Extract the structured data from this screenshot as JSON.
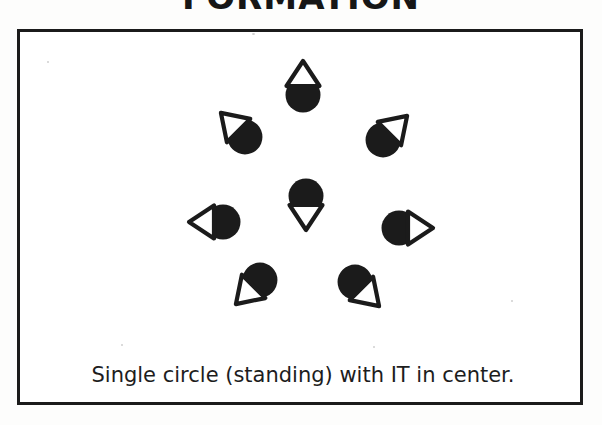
{
  "page": {
    "heading": "FORMATION",
    "caption": "Single circle (standing) with IT in center.",
    "colors": {
      "ink": "#1b1b1b",
      "paper": "#ffffff",
      "page_background": "#fdfdfc"
    }
  },
  "diagram": {
    "type": "formation-diagram",
    "symbol_legend": {
      "head": "filled black circle",
      "body": "outlined triangle pointing in facing direction"
    },
    "center_marker": "IT",
    "people": [
      {
        "id": "player-top",
        "role": "player",
        "position": "top",
        "cx": 283,
        "cy": 56,
        "facing_deg": 180,
        "label": ""
      },
      {
        "id": "player-upper-left",
        "role": "player",
        "position": "upper-left",
        "cx": 220,
        "cy": 100,
        "facing_deg": 135,
        "label": ""
      },
      {
        "id": "player-upper-right",
        "role": "player",
        "position": "upper-right",
        "cx": 368,
        "cy": 103,
        "facing_deg": 225,
        "label": ""
      },
      {
        "id": "it-center",
        "role": "it",
        "position": "center",
        "cx": 286,
        "cy": 171,
        "facing_deg": 0,
        "label": "IT"
      },
      {
        "id": "player-left",
        "role": "player",
        "position": "left",
        "cx": 196,
        "cy": 190,
        "facing_deg": 90,
        "label": ""
      },
      {
        "id": "player-right",
        "role": "player",
        "position": "right",
        "cx": 386,
        "cy": 196,
        "facing_deg": 270,
        "label": ""
      },
      {
        "id": "player-lower-left",
        "role": "player",
        "position": "lower-left",
        "cx": 235,
        "cy": 253,
        "facing_deg": 45,
        "label": ""
      },
      {
        "id": "player-lower-right",
        "role": "player",
        "position": "lower-right",
        "cx": 340,
        "cy": 255,
        "facing_deg": 315,
        "label": ""
      }
    ]
  }
}
